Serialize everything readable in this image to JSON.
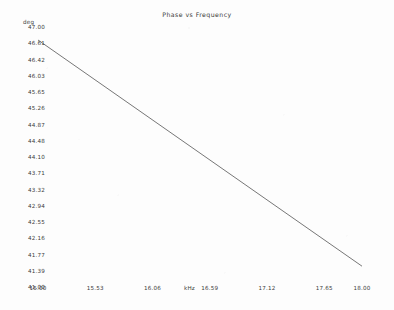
{
  "chart_data": {
    "type": "line",
    "title": "Phase vs Frequency",
    "xlabel": "kHz",
    "ylabel": "deg",
    "xlim": [
      15.0,
      18.0
    ],
    "ylim": [
      41.0,
      47.0
    ],
    "grid": false,
    "legend": null,
    "x_tick_labels": [
      "15.00",
      "15.53",
      "16.06",
      "16.59",
      "17.12",
      "17.65",
      "18.00"
    ],
    "x_tick_values": [
      15.0,
      15.53,
      16.06,
      16.59,
      17.12,
      17.65,
      18.0
    ],
    "y_tick_labels": [
      "47.00",
      "46.61",
      "46.42",
      "46.03",
      "45.65",
      "45.26",
      "44.87",
      "44.48",
      "44.10",
      "43.71",
      "43.32",
      "42.94",
      "42.55",
      "42.16",
      "41.77",
      "41.39",
      "41.00"
    ],
    "y_tick_values": [
      47.0,
      46.61,
      46.42,
      46.03,
      45.65,
      45.26,
      44.87,
      44.48,
      44.1,
      43.71,
      43.32,
      42.94,
      42.55,
      42.16,
      41.77,
      41.39,
      41.0
    ],
    "series": [
      {
        "name": "Phase",
        "color": "#3c3c3c",
        "x": [
          15.0,
          15.5,
          16.0,
          16.5,
          17.0,
          17.5,
          18.0
        ],
        "values": [
          46.7,
          45.83,
          44.96,
          44.09,
          43.22,
          42.35,
          41.48
        ]
      }
    ]
  }
}
